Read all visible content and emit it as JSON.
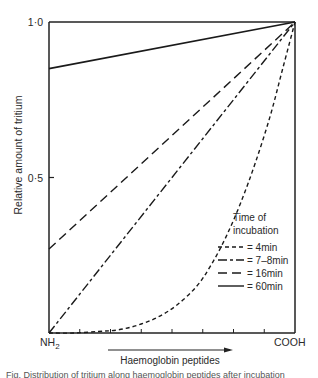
{
  "chart_data": {
    "type": "line",
    "title": "",
    "xlabel": "Haemoglobin peptides",
    "ylabel": "Relative amount of tritium",
    "x_start_label": "NH",
    "x_start_sub": "2",
    "x_end_label": "COOH",
    "x_range": [
      0,
      1
    ],
    "ylim": [
      0,
      1.0
    ],
    "y_ticks": [
      {
        "value": 0.5,
        "label": "0·5"
      },
      {
        "value": 1.0,
        "label": "1·0"
      }
    ],
    "x_minor_ticks": [
      0.125,
      0.25,
      0.375,
      0.5,
      0.625,
      0.75,
      0.875
    ],
    "grid": false,
    "legend": {
      "title_line1": "Time of",
      "title_line2": "incubation",
      "position": "lower-right inside"
    },
    "series": [
      {
        "name": "4min",
        "legend_label": "= 4min",
        "style": "short-dash",
        "x": [
          0.0,
          0.1,
          0.2,
          0.28,
          0.36,
          0.44,
          0.52,
          0.6,
          0.66,
          0.72,
          0.78,
          0.84,
          0.9,
          0.95,
          1.0
        ],
        "y": [
          0.0,
          0.0,
          0.005,
          0.01,
          0.025,
          0.05,
          0.09,
          0.15,
          0.22,
          0.31,
          0.42,
          0.55,
          0.7,
          0.85,
          1.0
        ]
      },
      {
        "name": "7-8min",
        "legend_label": "= 7–8min",
        "style": "dash-dot",
        "x": [
          0.0,
          1.0
        ],
        "y": [
          0.0,
          1.0
        ]
      },
      {
        "name": "16min",
        "legend_label": "= 16min",
        "style": "long-dash",
        "x": [
          0.0,
          1.0
        ],
        "y": [
          0.27,
          1.0
        ]
      },
      {
        "name": "60min",
        "legend_label": "= 60min",
        "style": "solid",
        "x": [
          0.0,
          1.0
        ],
        "y": [
          0.85,
          1.0
        ]
      }
    ]
  },
  "caption_fragment": "Fig. Distribution of tritium along haemoglobin peptides after incubation"
}
